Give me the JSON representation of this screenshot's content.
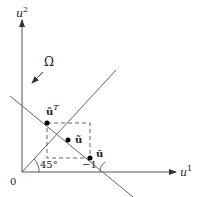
{
  "figure": {
    "axes": {
      "x_label_base": "u",
      "x_label_sup": "1",
      "y_label_base": "u",
      "y_label_sup": "2",
      "origin_label": "0"
    },
    "lines": {
      "constraint_label": "Ω",
      "diagonal_angle_label": "45°",
      "slope_label": "−1"
    },
    "points": {
      "transpose_point_base": "ũ",
      "transpose_point_sup": "T",
      "center_point_label": "ũ",
      "lower_point_label": "ū"
    },
    "colors": {
      "line": "#555555",
      "axis": "#333333",
      "point": "#000000"
    }
  }
}
